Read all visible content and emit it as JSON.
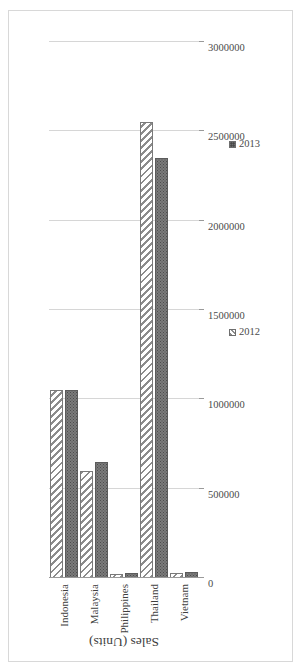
{
  "chart_data": {
    "type": "bar",
    "orientation": "horizontal",
    "rotated_page": true,
    "title": "",
    "xlabel": "",
    "ylabel": "Sales (Units)",
    "value_axis_title": "Sales (Units)",
    "categories": [
      "Indonesia",
      "Malaysia",
      "Philippines",
      "Thailand",
      "Vietnam"
    ],
    "series": [
      {
        "name": "2012",
        "marker": "diagonal-hatch",
        "values": [
          1050000,
          600000,
          25000,
          2550000,
          30000
        ]
      },
      {
        "name": "2013",
        "marker": "dark-stipple",
        "values": [
          1050000,
          650000,
          30000,
          2350000,
          35000
        ]
      }
    ],
    "tick_labels": [
      "0",
      "500000",
      "1000000",
      "1500000",
      "2000000",
      "2500000",
      "3000000"
    ],
    "tick_values": [
      0,
      500000,
      1000000,
      1500000,
      2000000,
      2500000,
      3000000
    ],
    "xlim": [
      0,
      3000000
    ],
    "grid": true,
    "grid_axis": "value",
    "legend": [
      "2012",
      "2013"
    ],
    "legend_position": "right"
  },
  "axis": {
    "title": "Sales (Units)"
  },
  "legend": {
    "items": [
      {
        "label": "2012"
      },
      {
        "label": "2013"
      }
    ]
  },
  "colors": {
    "series_2012": "#ffffff",
    "series_2013": "#7b7b7b",
    "gridline": "#d6d6d6",
    "axis": "#9a9a9a",
    "text": "#3f3f3f",
    "frame": "#d8d8d8",
    "background": "#ffffff"
  }
}
